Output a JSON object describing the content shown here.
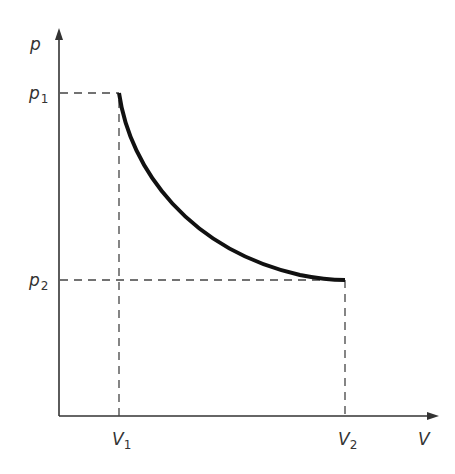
{
  "diagram": {
    "type": "p-V diagram",
    "axes": {
      "y_label": "p",
      "x_label": "V"
    },
    "ticks": {
      "p1": {
        "base": "p",
        "sub": "1"
      },
      "p2": {
        "base": "p",
        "sub": "2"
      },
      "V1": {
        "base": "V",
        "sub": "1"
      },
      "V2": {
        "base": "V",
        "sub": "2"
      }
    },
    "curve": {
      "description": "Decreasing curve from (V1, p1) to (V2, p2)",
      "start": [
        "V1",
        "p1"
      ],
      "end": [
        "V2",
        "p2"
      ]
    },
    "colors": {
      "axis": "#333333",
      "curve": "#111111",
      "dashed": "#444444",
      "text": "#333333"
    }
  }
}
